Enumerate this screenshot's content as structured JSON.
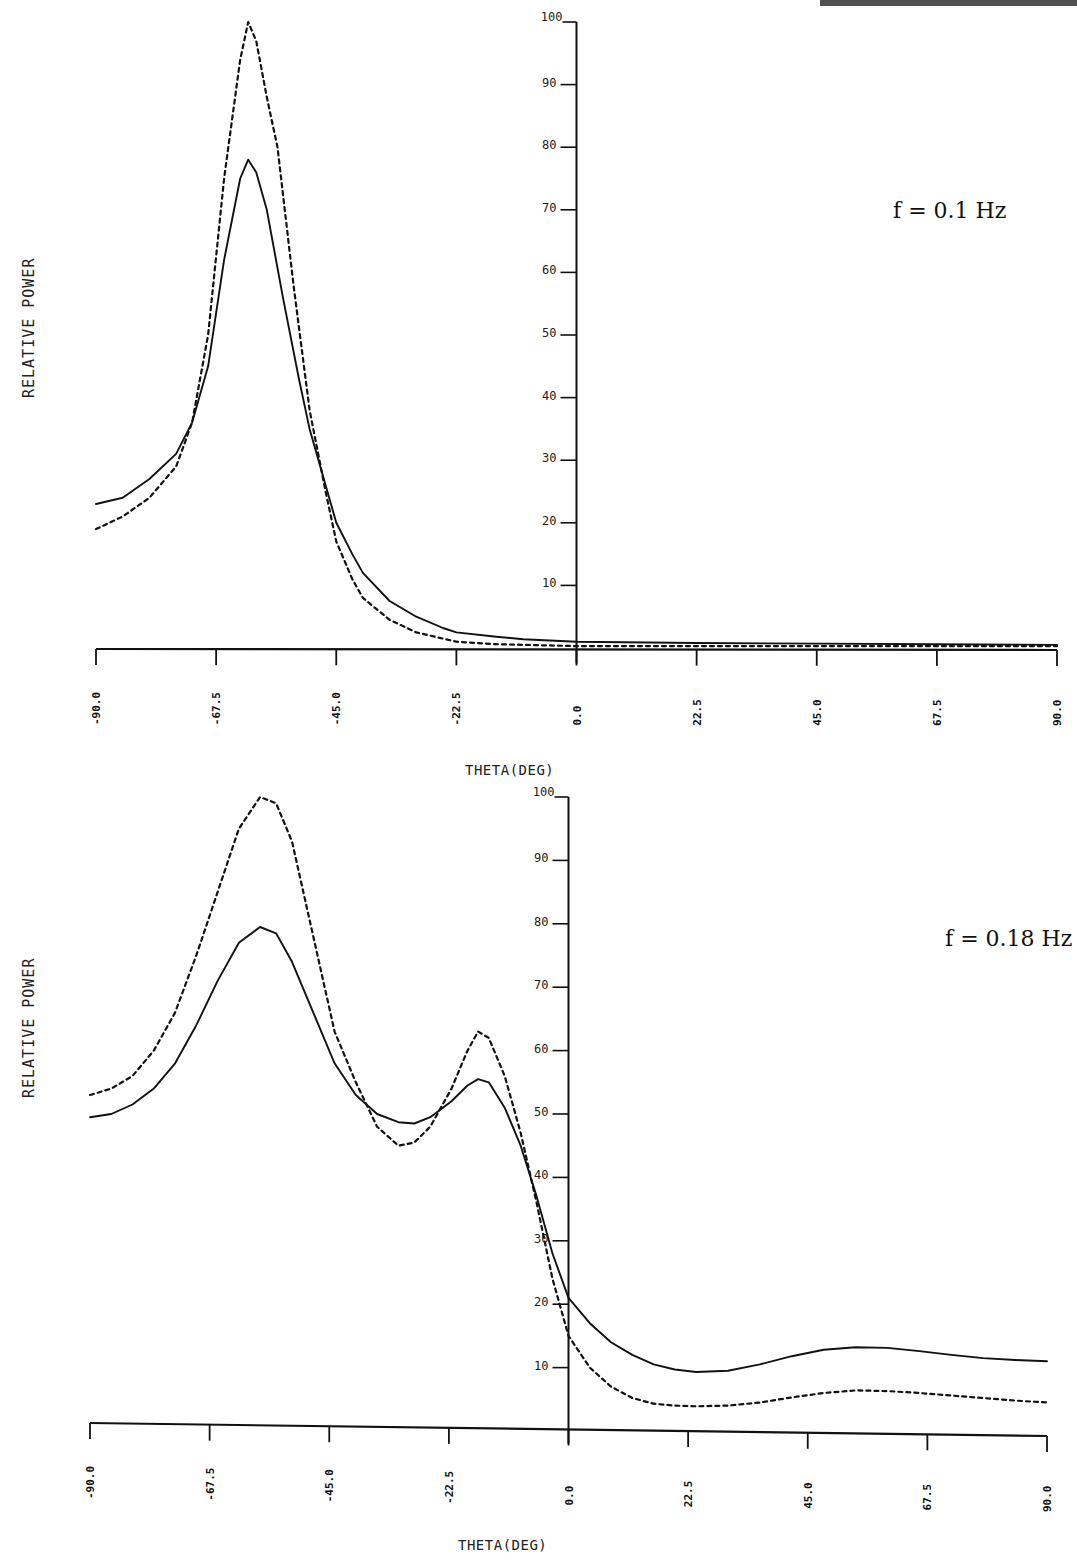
{
  "page": {
    "header_fragment": "cropped header text (illegible)"
  },
  "charts": [
    {
      "annotation": "f = 0.1 Hz",
      "ylabel": "RELATIVE POWER",
      "xlabel": "THETA(DEG)",
      "yticks": [
        "100",
        "90",
        "80",
        "70",
        "60",
        "50",
        "40",
        "30",
        "20",
        "10"
      ],
      "xticks": [
        "-90.0",
        "-67.5",
        "-45.0",
        "-22.5",
        "0.0",
        "22.5",
        "45.0",
        "67.5",
        "90.0"
      ]
    },
    {
      "annotation": "f = 0.18 Hz",
      "ylabel": "RELATIVE POWER",
      "xlabel": "THETA(DEG)",
      "yticks": [
        "100",
        "90",
        "80",
        "70",
        "60",
        "50",
        "40",
        "30",
        "20",
        "10"
      ],
      "xticks": [
        "-90.0",
        "-67.5",
        "-45.0",
        "-22.5",
        "0.0",
        "22.5",
        "45.0",
        "67.5",
        "90.0"
      ]
    }
  ],
  "chart_data": [
    {
      "type": "line",
      "title": "f = 0.1 Hz",
      "xlabel": "THETA(DEG)",
      "ylabel": "RELATIVE POWER",
      "xlim": [
        -90,
        90
      ],
      "ylim": [
        0,
        100
      ],
      "grid": false,
      "legend": "none",
      "xticks": [
        -90,
        -67.5,
        -45,
        -22.5,
        0,
        22.5,
        45,
        67.5,
        90
      ],
      "yticks": [
        10,
        20,
        30,
        40,
        50,
        60,
        70,
        80,
        90,
        100
      ],
      "series": [
        {
          "name": "solid",
          "style": "solid",
          "x": [
            -90,
            -85,
            -80,
            -75,
            -72,
            -69,
            -66,
            -63,
            -61.5,
            -60,
            -58,
            -55,
            -52,
            -50,
            -47,
            -45,
            -42,
            -40,
            -35,
            -30,
            -25,
            -22.5,
            -15,
            -10,
            0,
            22.5,
            45,
            67.5,
            90
          ],
          "y": [
            23,
            24,
            27,
            31,
            36,
            45,
            62,
            75,
            78,
            76,
            70,
            56,
            43,
            35,
            26,
            20,
            15,
            12,
            7.5,
            5,
            3.2,
            2.5,
            1.8,
            1.4,
            1.0,
            0.8,
            0.7,
            0.6,
            0.5
          ]
        },
        {
          "name": "dashed",
          "style": "dashed",
          "x": [
            -90,
            -85,
            -80,
            -75,
            -72,
            -69,
            -66,
            -63,
            -61.5,
            -60,
            -58,
            -56,
            -53,
            -50,
            -47,
            -45,
            -42,
            -40,
            -35,
            -30,
            -25,
            -22.5,
            -15,
            0,
            22.5,
            45,
            67.5,
            90
          ],
          "y": [
            19,
            21,
            24,
            29,
            36,
            50,
            75,
            94,
            100,
            97,
            88,
            80,
            58,
            38,
            25,
            17,
            11,
            8,
            4.5,
            2.5,
            1.5,
            1.0,
            0.6,
            0.3,
            0.3,
            0.3,
            0.3,
            0.3
          ]
        }
      ]
    },
    {
      "type": "line",
      "title": "f = 0.18 Hz",
      "xlabel": "THETA(DEG)",
      "ylabel": "RELATIVE POWER",
      "xlim": [
        -90,
        90
      ],
      "ylim": [
        0,
        100
      ],
      "grid": false,
      "legend": "none",
      "xticks": [
        -90,
        -67.5,
        -45,
        -22.5,
        0,
        22.5,
        45,
        67.5,
        90
      ],
      "yticks": [
        10,
        20,
        30,
        40,
        50,
        60,
        70,
        80,
        90,
        100
      ],
      "series": [
        {
          "name": "solid",
          "style": "solid",
          "x": [
            -90,
            -86,
            -82,
            -78,
            -74,
            -70,
            -66,
            -62,
            -58,
            -55,
            -52,
            -48,
            -44,
            -40,
            -36,
            -32,
            -29,
            -26,
            -22,
            -19,
            -17,
            -15,
            -12,
            -9,
            -6,
            -3,
            0,
            4,
            8,
            12,
            16,
            20,
            24,
            30,
            36,
            42,
            48,
            54,
            60,
            66,
            72,
            78,
            84,
            90
          ],
          "y": [
            49.5,
            50,
            51.5,
            54,
            58,
            64,
            71,
            77,
            79.5,
            78.5,
            74,
            66,
            58,
            53,
            50,
            48.7,
            48.5,
            49.5,
            52,
            54.5,
            55.5,
            55,
            51,
            45,
            37,
            28,
            21,
            17,
            14,
            12,
            10.5,
            9.7,
            9.3,
            9.5,
            10.5,
            11.8,
            12.8,
            13.2,
            13.1,
            12.6,
            12,
            11.5,
            11.2,
            11
          ]
        },
        {
          "name": "dashed",
          "style": "dashed",
          "x": [
            -90,
            -86,
            -82,
            -78,
            -74,
            -70,
            -66,
            -62,
            -58,
            -55,
            -52,
            -48,
            -44,
            -40,
            -36,
            -32,
            -29,
            -26,
            -22,
            -19,
            -17,
            -15,
            -12,
            -9,
            -6,
            -3,
            0,
            4,
            8,
            12,
            16,
            20,
            24,
            30,
            36,
            42,
            48,
            54,
            60,
            66,
            72,
            78,
            84,
            90
          ],
          "y": [
            53,
            54,
            56,
            60,
            66,
            75,
            85,
            95,
            100,
            99,
            93,
            78,
            63,
            55,
            48,
            45,
            45.5,
            48,
            54,
            60,
            63,
            62,
            56,
            47,
            36,
            24,
            15,
            10,
            7,
            5.2,
            4.3,
            4,
            3.9,
            4,
            4.5,
            5.3,
            6,
            6.4,
            6.3,
            6,
            5.6,
            5.2,
            4.8,
            4.5
          ]
        }
      ]
    }
  ]
}
